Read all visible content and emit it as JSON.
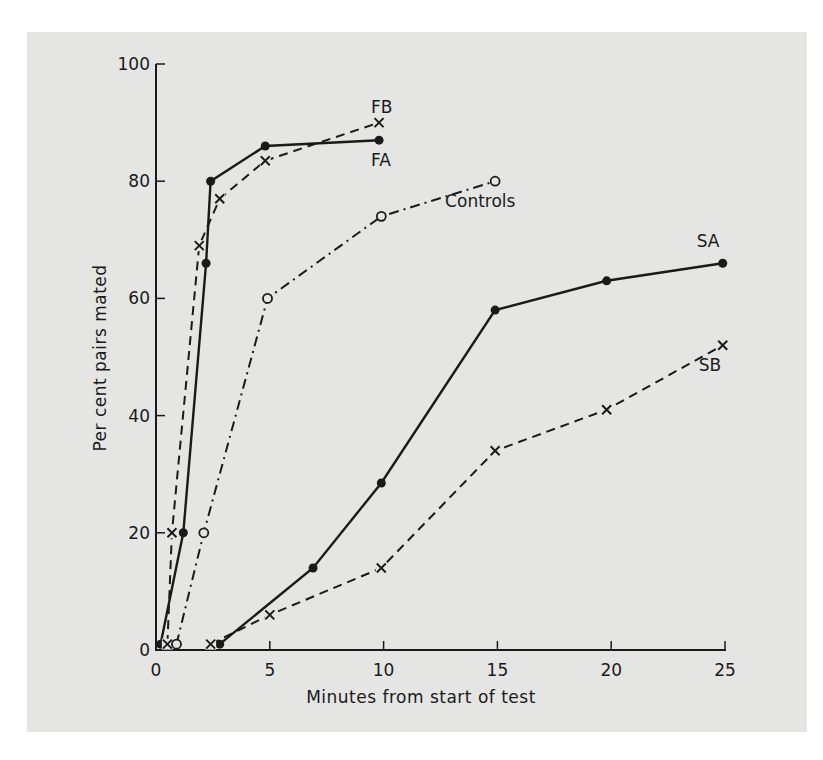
{
  "chart_data": {
    "type": "line",
    "title": "",
    "xlabel": "Minutes from start of test",
    "ylabel": "Per cent pairs mated",
    "xlim": [
      0,
      25
    ],
    "ylim": [
      0,
      100
    ],
    "xticks": [
      0,
      5,
      10,
      15,
      20,
      25
    ],
    "yticks": [
      0,
      20,
      40,
      60,
      80,
      100
    ],
    "xtick_labels": [
      "0",
      "5",
      "10",
      "15",
      "20",
      "25"
    ],
    "ytick_labels": [
      "0",
      "20",
      "40",
      "60",
      "80",
      "100"
    ],
    "grid": false,
    "legend": "inline labels at line ends",
    "series": [
      {
        "name": "FA",
        "line_style": "solid",
        "marker": "filled-circle",
        "x": [
          0.2,
          1.2,
          2.2,
          2.4,
          4.8,
          9.8
        ],
        "y": [
          1,
          20,
          66,
          80,
          86,
          87
        ],
        "label_anchor": "below-end"
      },
      {
        "name": "FB",
        "line_style": "dashed",
        "marker": "x",
        "x": [
          0.5,
          0.7,
          1.9,
          2.8,
          4.8,
          9.8
        ],
        "y": [
          1,
          20,
          69,
          77,
          83.5,
          90
        ],
        "label_anchor": "above-end"
      },
      {
        "name": "Controls",
        "line_style": "dash-dot",
        "marker": "open-circle",
        "x": [
          0.9,
          2.1,
          4.9,
          9.9,
          14.9
        ],
        "y": [
          1,
          20,
          60,
          74,
          80
        ],
        "label_anchor": "below-end"
      },
      {
        "name": "SA",
        "line_style": "solid",
        "marker": "filled-circle",
        "x": [
          2.8,
          6.9,
          9.9,
          14.9,
          19.8,
          24.9
        ],
        "y": [
          1,
          14,
          28.5,
          58,
          63,
          66
        ],
        "label_anchor": "above-end"
      },
      {
        "name": "SB",
        "line_style": "dashed",
        "marker": "x",
        "x": [
          2.4,
          5.0,
          9.9,
          14.9,
          19.8,
          24.9
        ],
        "y": [
          1,
          6,
          14,
          34,
          41,
          52
        ],
        "label_anchor": "below-end"
      }
    ]
  },
  "colors": {
    "ink": "#1a1a1a",
    "panel": "#e5e5e3",
    "background": "#ffffff"
  }
}
